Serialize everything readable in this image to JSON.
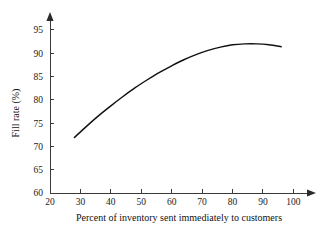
{
  "chart_data": {
    "type": "line",
    "title": "",
    "xlabel": "Percent of inventory sent immediately to customers",
    "ylabel": "Fill rate (%)",
    "xlim": [
      20,
      100
    ],
    "ylim": [
      60,
      97
    ],
    "xticks": [
      20,
      30,
      40,
      50,
      60,
      70,
      80,
      90,
      100
    ],
    "yticks": [
      60,
      65,
      70,
      75,
      80,
      85,
      90,
      95
    ],
    "xtick_labels": [
      "20",
      "30",
      "40",
      "50",
      "60",
      "70",
      "80",
      "90",
      "100"
    ],
    "ytick_labels": [
      "60",
      "65",
      "70",
      "75",
      "80",
      "85",
      "90",
      "95"
    ],
    "grid": false,
    "legend": false,
    "legend_position": "none",
    "x_axis_arrow": true,
    "y_axis_arrow": true,
    "line_color": "#111111",
    "axis_color": "#3a3a3a",
    "background_color": "#ffffff",
    "series": [
      {
        "name": "Fill rate",
        "x": [
          28,
          32,
          36,
          40,
          44,
          48,
          52,
          56,
          60,
          64,
          68,
          72,
          76,
          80,
          84,
          88,
          92,
          96
        ],
        "values": [
          71.9,
          74.3,
          76.6,
          78.7,
          80.7,
          82.6,
          84.3,
          85.9,
          87.3,
          88.6,
          89.7,
          90.6,
          91.3,
          91.8,
          92.0,
          92.0,
          91.8,
          91.4
        ]
      }
    ]
  },
  "axis_titles": {
    "x": "Percent of inventory sent immediately to customers",
    "y": "Fill rate (%)"
  }
}
